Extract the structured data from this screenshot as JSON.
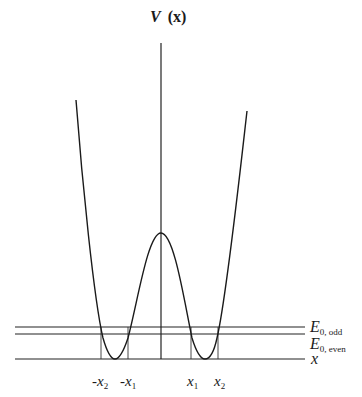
{
  "diagram": {
    "y_axis_label": {
      "main": "V",
      "arg": "(x)"
    },
    "x_axis_label": "x",
    "energy_levels": [
      {
        "name": "odd",
        "label_main": "E",
        "label_sub": "0, odd"
      },
      {
        "name": "even",
        "label_main": "E",
        "label_sub": "0, even"
      }
    ],
    "turning_points": [
      {
        "name": "neg-x2",
        "sign": "-",
        "main": "x",
        "sub": "2"
      },
      {
        "name": "neg-x1",
        "sign": "-",
        "main": "x",
        "sub": "1"
      },
      {
        "name": "x1",
        "sign": "",
        "main": "x",
        "sub": "1"
      },
      {
        "name": "x2",
        "sign": "",
        "main": "x",
        "sub": "2"
      }
    ]
  }
}
